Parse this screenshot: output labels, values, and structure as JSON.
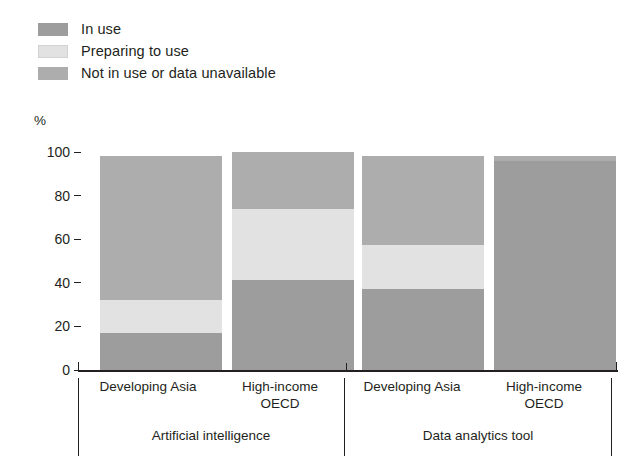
{
  "legend": {
    "items": [
      {
        "label": "In use",
        "color": "#9d9d9d",
        "key": "in_use"
      },
      {
        "label": "Preparing to use",
        "color": "#e2e2e2",
        "key": "preparing"
      },
      {
        "label": "Not in use or data unavailable",
        "color": "#adadad",
        "key": "not_in_use"
      }
    ]
  },
  "axis": {
    "unit": "%",
    "ticks": [
      "100",
      "80",
      "60",
      "40",
      "20",
      "0"
    ]
  },
  "groups": [
    {
      "label": "Artificial intelligence"
    },
    {
      "label": "Data analytics tool"
    }
  ],
  "categories": [
    {
      "line1": "Developing Asia",
      "line2": ""
    },
    {
      "line1": "High-income",
      "line2": "OECD"
    },
    {
      "line1": "Developing Asia",
      "line2": ""
    },
    {
      "line1": "High-income",
      "line2": "OECD"
    }
  ],
  "chart_data": {
    "type": "bar",
    "subtype": "stacked-vertical",
    "title": "",
    "xlabel": "",
    "ylabel": "%",
    "ylim": [
      0,
      100
    ],
    "yticks": [
      0,
      20,
      40,
      60,
      80,
      100
    ],
    "grid": false,
    "legend_position": "top-left",
    "categories": [
      "Artificial intelligence — Developing Asia",
      "Artificial intelligence — High-income OECD",
      "Data analytics tool — Developing Asia",
      "Data analytics tool — High-income OECD"
    ],
    "series": [
      {
        "name": "In use",
        "color": "#9d9d9d",
        "values": [
          17,
          41.5,
          37,
          96
        ]
      },
      {
        "name": "Preparing to use",
        "color": "#e2e2e2",
        "values": [
          15,
          32.5,
          20.5,
          0
        ]
      },
      {
        "name": "Not in use or data unavailable",
        "color": "#adadad",
        "values": [
          66,
          26,
          40.5,
          2
        ]
      }
    ],
    "totals": [
      98,
      100,
      98,
      98
    ]
  }
}
